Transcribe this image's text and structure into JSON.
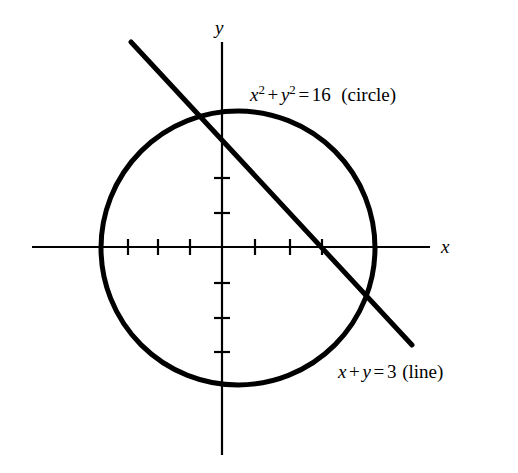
{
  "figure": {
    "type": "math-graph",
    "background_color": "#ffffff",
    "stroke_color": "#000000",
    "width": 518,
    "height": 473
  },
  "axes": {
    "x_label": "x",
    "y_label": "y",
    "origin": {
      "x": 222,
      "y": 247
    },
    "x_axis": {
      "start_x": 32,
      "end_x": 430,
      "y": 247
    },
    "y_axis": {
      "x": 222,
      "start_y": 42,
      "end_y": 455
    },
    "x_ticks_px": [
      128,
      158,
      190,
      255,
      290,
      322
    ],
    "y_ticks_px": [
      178,
      213,
      283,
      318,
      352
    ],
    "tick_half_length": 8,
    "unit_px_x": 33,
    "unit_px_y": 35
  },
  "circle": {
    "label_text": {
      "var_x": "x",
      "exp_x": "2",
      "plus": "+",
      "var_y": "y",
      "exp_y": "2",
      "equals": "=",
      "value": "16",
      "name": "(circle)"
    },
    "label_position": {
      "x": 250,
      "y": 84
    },
    "center_px": {
      "x": 238,
      "y": 248
    },
    "radius_px": 137,
    "stroke_width": 5
  },
  "line": {
    "label_text": {
      "var_x": "x",
      "plus": "+",
      "var_y": "y",
      "equals": "=",
      "value": "3",
      "name": "(line)"
    },
    "label_position": {
      "x": 338,
      "y": 362
    },
    "start_px": {
      "x": 131,
      "y": 42
    },
    "end_px": {
      "x": 412,
      "y": 345
    },
    "stroke_width": 5
  },
  "chart_data": {
    "type": "scatter",
    "title": "",
    "xlabel": "x",
    "ylabel": "y",
    "grid": false,
    "legend": "none",
    "xlim": [
      -5.75,
      6.3
    ],
    "ylim": [
      -5.85,
      5.85
    ],
    "xticks": [
      -3,
      -2,
      -1,
      1,
      2,
      3
    ],
    "yticks": [
      1,
      2,
      -1,
      -2,
      -3
    ],
    "series": [
      {
        "name": "circle",
        "kind": "circle",
        "equation": "x^2 + y^2 = 16",
        "annotation": "x² + y² = 16  (circle)",
        "center": [
          0,
          0
        ],
        "radius": 4
      },
      {
        "name": "line",
        "kind": "line",
        "equation": "x + y = 3",
        "annotation": "x + y = 3 (line)",
        "slope": -1,
        "intercept": 3,
        "x_range": [
          -2.75,
          5.75
        ]
      }
    ],
    "intersections": [
      [
        -0.646,
        3.646
      ],
      [
        3.646,
        -0.646
      ]
    ]
  }
}
